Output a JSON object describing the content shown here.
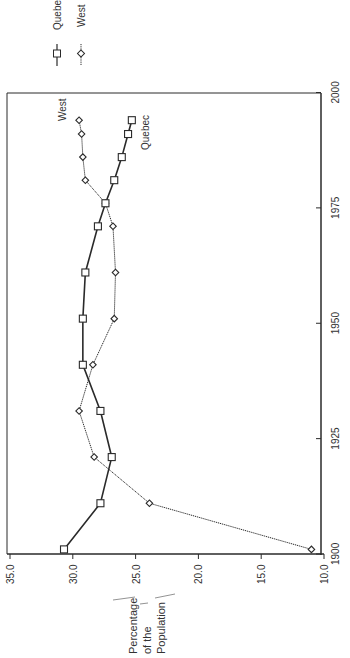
{
  "chart_data": {
    "type": "line",
    "orientation": "rotated-90-clockwise",
    "title": "",
    "xlabel": "",
    "ylabel": "Percentage of the Population",
    "ylabel_lines": [
      "Percentage",
      "of the",
      "Population"
    ],
    "xlim": [
      1900,
      2000
    ],
    "ylim": [
      10.0,
      35.0
    ],
    "x_ticks": [
      "1900",
      "1925",
      "1950",
      "1975",
      "2000"
    ],
    "x_tick_values": [
      1900,
      1925,
      1950,
      1975,
      2000
    ],
    "y_ticks": [
      "35.0",
      "30.0",
      "25.0",
      "20.0",
      "15.0",
      "10.0"
    ],
    "y_tick_values": [
      35,
      30,
      25,
      20,
      15,
      10
    ],
    "grid": false,
    "legend_position": "top-outside",
    "x": [
      1901,
      1911,
      1921,
      1931,
      1941,
      1951,
      1961,
      1971,
      1976,
      1981,
      1986,
      1991,
      1994
    ],
    "series": [
      {
        "name": "Quebec",
        "marker": "square",
        "line_style": "solid",
        "values": [
          30.7,
          27.8,
          26.9,
          27.8,
          29.2,
          29.2,
          29.0,
          28.0,
          27.4,
          26.7,
          26.1,
          25.6,
          25.3
        ]
      },
      {
        "name": "West",
        "marker": "diamond",
        "line_style": "dotted",
        "values": [
          11.0,
          23.9,
          28.3,
          29.5,
          28.4,
          26.7,
          26.6,
          26.8,
          27.4,
          29.0,
          29.2,
          29.3,
          29.5
        ]
      }
    ],
    "annotations": [
      {
        "text": "West",
        "near": "West series end"
      },
      {
        "text": "Quebec",
        "near": "Quebec series end"
      }
    ]
  },
  "legend": {
    "items": [
      {
        "label": "Quebec",
        "marker": "square",
        "line": "solid"
      },
      {
        "label": "West",
        "marker": "diamond",
        "line": "dotted"
      }
    ]
  },
  "annotations": {
    "west_label": "West",
    "quebec_label": "Quebec"
  },
  "colors": {
    "line": "#2a2a2a",
    "axis": "#2a2a2a",
    "background": "#ffffff"
  }
}
